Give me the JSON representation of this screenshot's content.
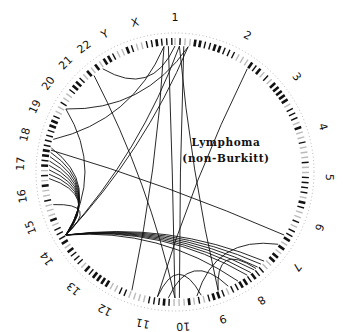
{
  "diagram": {
    "title_line1": "Lymphoma",
    "title_line2": "(non-Burkitt)",
    "type": "circular-genome-translocation-plot",
    "colors": {
      "ink": "#111111",
      "background": "#ffffff",
      "scale": "#888888"
    },
    "chromosomes": [
      {
        "name": "1",
        "angle": 0
      },
      {
        "name": "2",
        "angle": 28
      },
      {
        "name": "3",
        "angle": 52
      },
      {
        "name": "4",
        "angle": 73
      },
      {
        "name": "5",
        "angle": 92
      },
      {
        "name": "6",
        "angle": 111
      },
      {
        "name": "7",
        "angle": 128
      },
      {
        "name": "8",
        "angle": 146
      },
      {
        "name": "9",
        "angle": 162
      },
      {
        "name": "10",
        "angle": 177
      },
      {
        "name": "11",
        "angle": 192
      },
      {
        "name": "12",
        "angle": 207
      },
      {
        "name": "13",
        "angle": 221
      },
      {
        "name": "14",
        "angle": 236
      },
      {
        "name": "15",
        "angle": 249
      },
      {
        "name": "16",
        "angle": 261
      },
      {
        "name": "17",
        "angle": 273
      },
      {
        "name": "18",
        "angle": 284
      },
      {
        "name": "19",
        "angle": 295
      },
      {
        "name": "20",
        "angle": 305
      },
      {
        "name": "21",
        "angle": 315
      },
      {
        "name": "22",
        "angle": 324
      },
      {
        "name": "Y",
        "angle": 333
      },
      {
        "name": "X",
        "angle": 345
      }
    ],
    "links": [
      {
        "from": 240,
        "to": 281
      },
      {
        "from": 240,
        "to": 279
      },
      {
        "from": 240,
        "to": 277
      },
      {
        "from": 240,
        "to": 275
      },
      {
        "from": 240,
        "to": 273
      },
      {
        "from": 240,
        "to": 271
      },
      {
        "from": 240,
        "to": 269
      },
      {
        "from": 240,
        "to": 267
      },
      {
        "from": 240,
        "to": 255
      },
      {
        "from": 240,
        "to": 145
      },
      {
        "from": 240,
        "to": 143
      },
      {
        "from": 240,
        "to": 141
      },
      {
        "from": 240,
        "to": 139
      },
      {
        "from": 240,
        "to": 137
      },
      {
        "from": 240,
        "to": 135
      },
      {
        "from": 240,
        "to": 150
      },
      {
        "from": 240,
        "to": 2
      },
      {
        "from": 240,
        "to": 6
      },
      {
        "from": 240,
        "to": 300
      },
      {
        "from": 300,
        "to": 6
      },
      {
        "from": 320,
        "to": 180
      },
      {
        "from": 325,
        "to": 0
      },
      {
        "from": 280,
        "to": 120
      },
      {
        "from": 35,
        "to": 188
      },
      {
        "from": 178,
        "to": 4
      },
      {
        "from": 180,
        "to": -3
      },
      {
        "from": 155,
        "to": 183
      },
      {
        "from": 168,
        "to": 188
      },
      {
        "from": 160,
        "to": 140
      },
      {
        "from": 170,
        "to": 125
      },
      {
        "from": 285,
        "to": 355
      },
      {
        "from": -5,
        "to": 200
      },
      {
        "from": 2,
        "to": 160
      }
    ]
  }
}
